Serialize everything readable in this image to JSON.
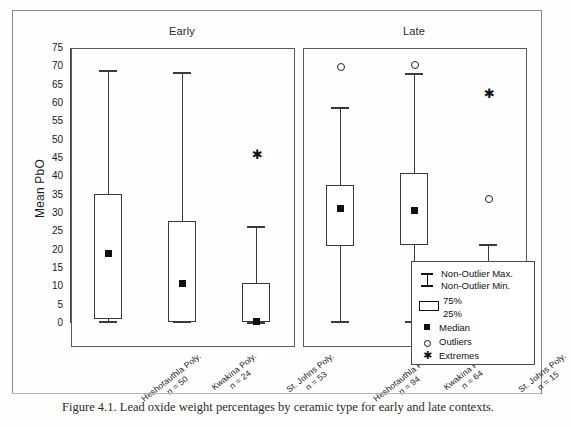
{
  "figure": {
    "caption": "Figure 4.1. Lead oxide weight percentages by ceramic type for early and late contexts.",
    "y_axis_title": "Mean PbO"
  },
  "panels": [
    {
      "title": "Early"
    },
    {
      "title": "Late"
    }
  ],
  "legend": {
    "items": [
      {
        "symbol": "whisker-cap-icon",
        "label_top": "Non-Outlier Max.",
        "label_bottom": "Non-Outlier Min."
      },
      {
        "symbol": "box-icon",
        "label_top": "75%",
        "label_bottom": "25%"
      },
      {
        "symbol": "filled-square-icon",
        "label_top": "Median",
        "label_bottom": ""
      },
      {
        "symbol": "open-circle-icon",
        "label_top": "Outliers",
        "label_bottom": ""
      },
      {
        "symbol": "asterisk-icon",
        "label_top": "Extremes",
        "label_bottom": ""
      }
    ]
  },
  "chart_data": {
    "type": "box",
    "title": "Figure 4.1. Lead oxide weight percentages by ceramic type for early and late contexts.",
    "xlabel": "",
    "ylabel": "Mean PbO",
    "ylim": [
      0,
      75
    ],
    "yticks": [
      0,
      5,
      10,
      15,
      20,
      25,
      30,
      35,
      40,
      45,
      50,
      55,
      60,
      65,
      70,
      75
    ],
    "grid": false,
    "legend_position": "right-bottom",
    "panels": [
      {
        "name": "Early",
        "boxes": [
          {
            "category": "Heshotauthla Poly.",
            "n": 50,
            "n_label": "n = 50",
            "q25": 1.2,
            "q75": 35.2,
            "median": 19.0,
            "whisker_min": 0.2,
            "whisker_max": 68.8,
            "outliers": [],
            "extremes": []
          },
          {
            "category": "Kwakina Poly.",
            "n": 24,
            "n_label": "n = 24",
            "q25": 0.4,
            "q75": 27.8,
            "median": 10.7,
            "whisker_min": 0.2,
            "whisker_max": 68.3,
            "outliers": [],
            "extremes": []
          },
          {
            "category": "St. Johns Poly.",
            "n": 53,
            "n_label": "n = 53",
            "q25": 0.2,
            "q75": 10.8,
            "median": 0.5,
            "whisker_min": 0.1,
            "whisker_max": 26.2,
            "outliers": [],
            "extremes": [
              46.3
            ]
          }
        ]
      },
      {
        "name": "Late",
        "boxes": [
          {
            "category": "Heshotauthla Poly.",
            "n": 94,
            "n_label": "n = 94",
            "q25": 21.0,
            "q75": 37.6,
            "median": 31.3,
            "whisker_min": 0.4,
            "whisker_max": 58.6,
            "outliers": [
              70.1
            ],
            "extremes": []
          },
          {
            "category": "Kwakina Poly.",
            "n": 64,
            "n_label": "n = 64",
            "q25": 21.4,
            "q75": 41.0,
            "median": 30.8,
            "whisker_min": 0.3,
            "whisker_max": 68.0,
            "outliers": [
              70.6
            ],
            "extremes": []
          },
          {
            "category": "St. Johns Poly.",
            "n": 15,
            "n_label": "n = 15",
            "q25": 0.7,
            "q75": 9.6,
            "median": 6.9,
            "whisker_min": 0.2,
            "whisker_max": 21.4,
            "outliers": [
              34.0
            ],
            "extremes": [
              63.0
            ]
          }
        ]
      }
    ]
  }
}
